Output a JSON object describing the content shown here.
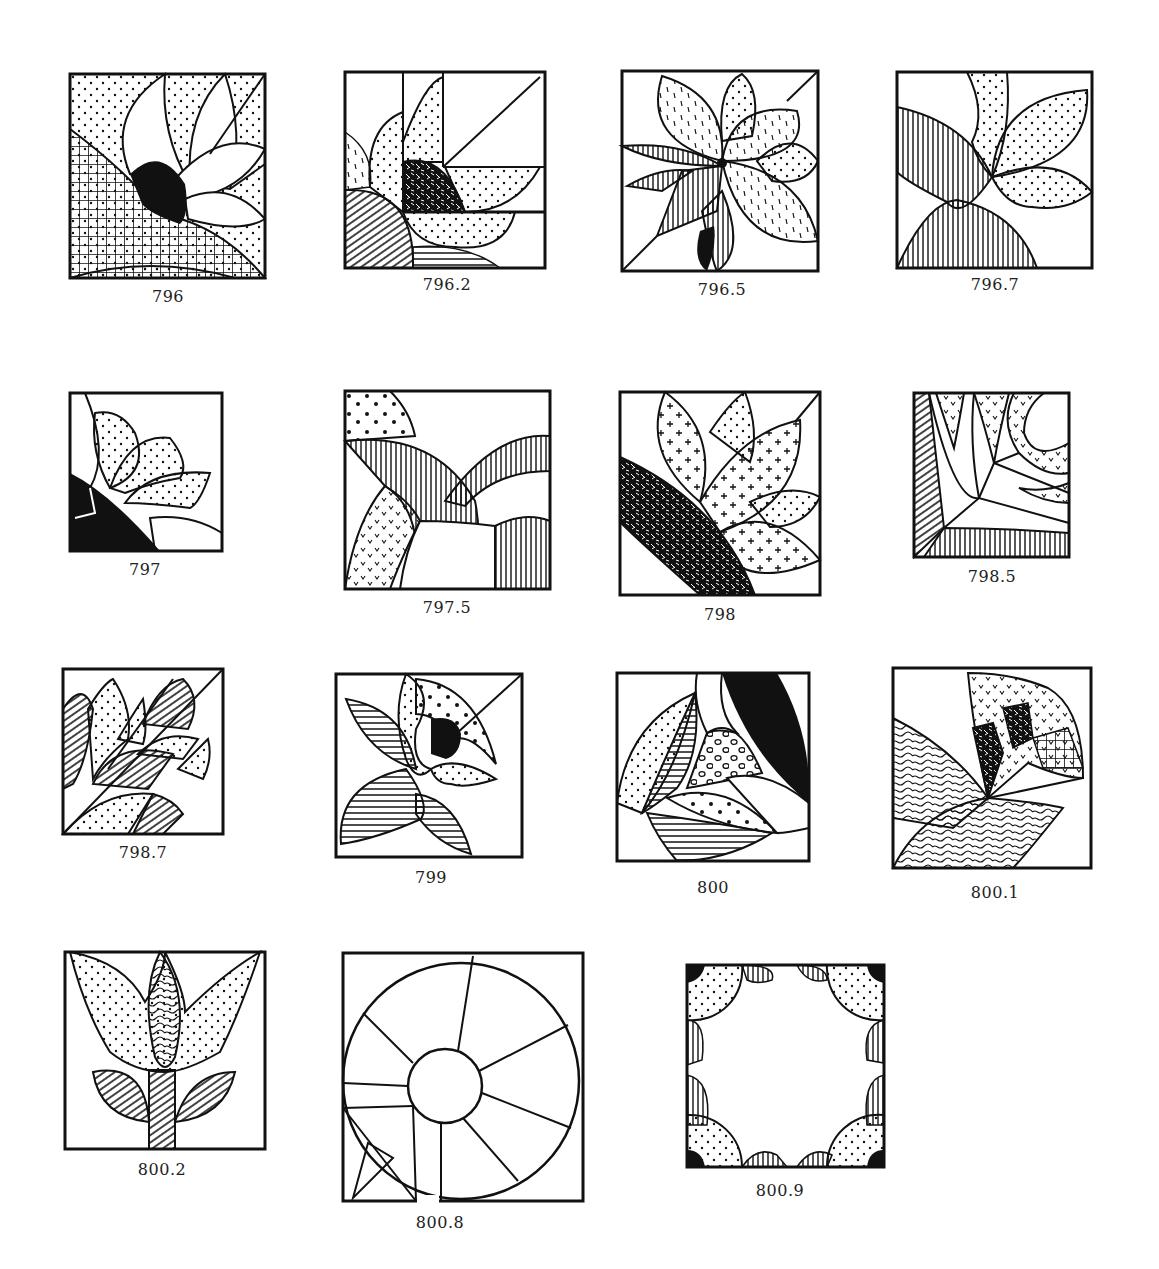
{
  "page": {
    "background": "#ffffff",
    "ink": "#111111"
  },
  "blocks": [
    {
      "id": "796",
      "label": "796",
      "x": 70,
      "y": 74,
      "w": 195,
      "h": 204,
      "label_x": 168,
      "label_y": 287,
      "motif": "quarter sunflower with black center, grid-hatched arc, dotted petals"
    },
    {
      "id": "796.2",
      "label": "796.2",
      "x": 345,
      "y": 72,
      "w": 200,
      "h": 196,
      "label_x": 447,
      "label_y": 275,
      "motif": "quarter fan with woven center, dotted and dashed petals in grid"
    },
    {
      "id": "796.5",
      "label": "796.5",
      "x": 622,
      "y": 71,
      "w": 196,
      "h": 200,
      "label_x": 722,
      "label_y": 280,
      "motif": "eight-petal flower with striped and dashed leaves"
    },
    {
      "id": "796.7",
      "label": "796.7",
      "x": 897,
      "y": 72,
      "w": 195,
      "h": 196,
      "label_x": 995,
      "label_y": 275,
      "motif": "dotted tulip petals over two vertical-striped leaves"
    },
    {
      "id": "797",
      "label": "797",
      "x": 70,
      "y": 393,
      "w": 152,
      "h": 158,
      "label_x": 145,
      "label_y": 560,
      "motif": "dotted fan petals with black corner arc"
    },
    {
      "id": "797.5",
      "label": "797.5",
      "x": 345,
      "y": 391,
      "w": 205,
      "h": 198,
      "label_x": 447,
      "label_y": 598,
      "motif": "overlapping striped arcs with speckled band"
    },
    {
      "id": "798",
      "label": "798",
      "x": 620,
      "y": 392,
      "w": 200,
      "h": 203,
      "label_x": 720,
      "label_y": 605,
      "motif": "cross-dotted petals with woven diagonal leaf"
    },
    {
      "id": "798.5",
      "label": "798.5",
      "x": 914,
      "y": 393,
      "w": 155,
      "h": 164,
      "label_x": 992,
      "label_y": 567,
      "motif": "curved star with check-marked wedges and striped border"
    },
    {
      "id": "798.7",
      "label": "798.7",
      "x": 63,
      "y": 669,
      "w": 160,
      "h": 165,
      "label_x": 143,
      "label_y": 843,
      "motif": "diagonal fan strips with hatched and dotted arcs"
    },
    {
      "id": "799",
      "label": "799",
      "x": 336,
      "y": 674,
      "w": 186,
      "h": 183,
      "label_x": 431,
      "label_y": 868,
      "motif": "tulip with black center and striped leaves"
    },
    {
      "id": "800",
      "label": "800",
      "x": 617,
      "y": 673,
      "w": 192,
      "h": 188,
      "label_x": 713,
      "label_y": 878,
      "motif": "curved petals: black, circles, dots, stripes"
    },
    {
      "id": "800.1",
      "label": "800.1",
      "x": 893,
      "y": 668,
      "w": 198,
      "h": 200,
      "label_x": 995,
      "label_y": 883,
      "motif": "wavy-pattern fan with patchwork arc"
    },
    {
      "id": "800.2",
      "label": "800.2",
      "x": 65,
      "y": 952,
      "w": 200,
      "h": 197,
      "label_x": 162,
      "label_y": 1160,
      "motif": "tulip with swirled bud, dotted petals, hatched leaves and stem"
    },
    {
      "id": "800.8",
      "label": "800.8",
      "x": 343,
      "y": 953,
      "w": 240,
      "h": 248,
      "label_x": 440,
      "label_y": 1213,
      "motif": "spoked wheel circle with center hub and triangle inset"
    },
    {
      "id": "800.9",
      "label": "800.9",
      "x": 687,
      "y": 965,
      "w": 197,
      "h": 202,
      "label_x": 780,
      "label_y": 1181,
      "motif": "dotted quarter circles in corners with hatched accents"
    }
  ]
}
